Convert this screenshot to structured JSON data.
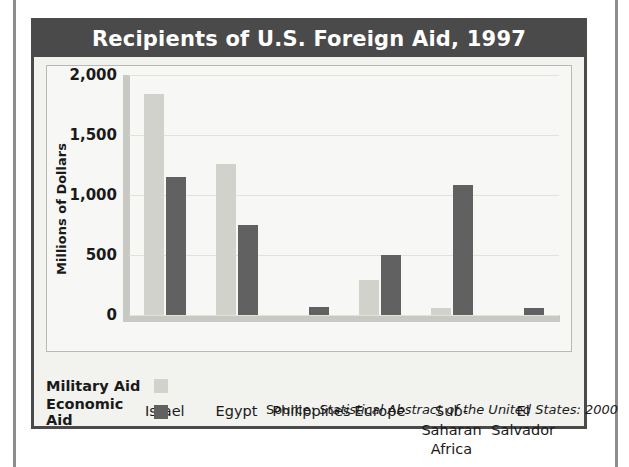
{
  "figure": {
    "title": "Recipients of U.S. Foreign Aid, 1997",
    "source_prefix": "Source: ",
    "source_italic": "Statistical Abstract of the United States: 2000"
  },
  "legend": {
    "military_label": "Military Aid",
    "economic_label": "Economic Aid",
    "military_color": "#d2d2cd",
    "economic_color": "#616161"
  },
  "chart_data": {
    "type": "bar",
    "title": "Recipients of U.S. Foreign Aid, 1997",
    "xlabel": "",
    "ylabel": "Millions of Dollars",
    "ylim": [
      0,
      2000
    ],
    "yticks": [
      0,
      500,
      1000,
      1500,
      2000
    ],
    "ytick_labels": [
      "0",
      "500",
      "1,000",
      "1,500",
      "2,000"
    ],
    "grid": true,
    "legend_position": "bottom-left",
    "categories": [
      "Israel",
      "Egypt",
      "Philippines",
      "Europe",
      "Sub-Saharan Africa",
      "El Salvador"
    ],
    "category_lines": [
      [
        "Israel"
      ],
      [
        "Egypt"
      ],
      [
        "Philippines"
      ],
      [
        "Europe"
      ],
      [
        "Sub-Saharan",
        "Africa"
      ],
      [
        "El",
        "Salvador"
      ]
    ],
    "series": [
      {
        "name": "Military Aid",
        "color": "#d2d2cd",
        "values": [
          1840,
          1260,
          0,
          290,
          55,
          0
        ]
      },
      {
        "name": "Economic Aid",
        "color": "#616161",
        "values": [
          1150,
          750,
          65,
          500,
          1080,
          60
        ]
      }
    ]
  }
}
